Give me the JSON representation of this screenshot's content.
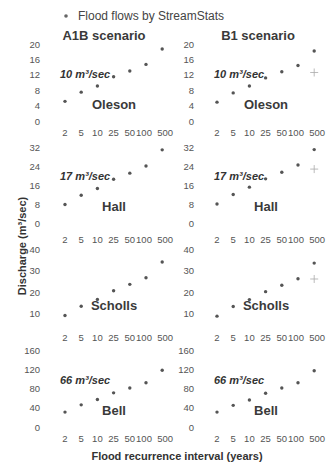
{
  "chart_data": {
    "type": "scatter",
    "legend": {
      "label": "Flood flows by StreamStats",
      "marker": "dot",
      "placement": "top"
    },
    "xlabel": "Flood recurrence interval (years)",
    "ylabel": "Discharge (m³/sec)",
    "categories": [
      "2",
      "5",
      "10",
      "25",
      "50",
      "100",
      "500"
    ],
    "colors": {
      "points": "#555555",
      "plus": "#aaaaaa",
      "text": "#333333"
    },
    "scenarios": [
      "A1B scenario",
      "B1 scenario"
    ],
    "panels": [
      {
        "site": "Oleson",
        "annotation": "10 m³/sec",
        "ylim": [
          0,
          20
        ],
        "yticks": [
          0,
          4,
          8,
          12,
          16,
          20
        ],
        "series": [
          {
            "scenario": "A1B scenario",
            "values": [
              5.1,
              7.5,
              9.1,
              11.5,
              13.0,
              14.7,
              18.7
            ],
            "plus": null
          },
          {
            "scenario": "B1 scenario",
            "values": [
              4.9,
              7.3,
              9.1,
              11.2,
              12.8,
              14.4,
              18.2
            ],
            "plus": {
              "x": "500",
              "y": 12.6
            }
          }
        ]
      },
      {
        "site": "Hall",
        "annotation": "17 m³/sec",
        "ylim": [
          0,
          32
        ],
        "yticks": [
          0,
          8,
          16,
          24,
          32
        ],
        "series": [
          {
            "scenario": "A1B scenario",
            "values": [
              7.8,
              11.7,
              14.5,
              18.4,
              21.0,
              24.0,
              30.8
            ],
            "plus": null
          },
          {
            "scenario": "B1 scenario",
            "values": [
              8.0,
              12.0,
              15.1,
              18.6,
              21.4,
              24.4,
              30.9
            ],
            "plus": {
              "x": "500",
              "y": 22.7
            }
          }
        ]
      },
      {
        "site": "Scholls",
        "annotation": "",
        "ylim": [
          7,
          41
        ],
        "yticks": [
          10,
          20,
          30,
          40
        ],
        "series": [
          {
            "scenario": "A1B scenario",
            "values": [
              9.1,
              13.4,
              16.6,
              20.6,
              23.6,
              26.7,
              34.0
            ],
            "plus": null
          },
          {
            "scenario": "B1 scenario",
            "values": [
              8.8,
              13.3,
              16.5,
              20.2,
              23.2,
              26.2,
              33.5
            ],
            "plus": {
              "x": "500",
              "y": 26.1
            }
          }
        ]
      },
      {
        "site": "Bell",
        "annotation": "66 m³/sec",
        "ylim": [
          0,
          160
        ],
        "yticks": [
          0,
          40,
          80,
          120,
          160
        ],
        "series": [
          {
            "scenario": "A1B scenario",
            "values": [
              31,
              46,
              57,
              71,
              81,
              92,
              118
            ],
            "plus": null
          },
          {
            "scenario": "B1 scenario",
            "values": [
              31,
              45,
              56,
              70,
              81,
              92,
              117
            ],
            "plus": null
          }
        ]
      }
    ]
  }
}
